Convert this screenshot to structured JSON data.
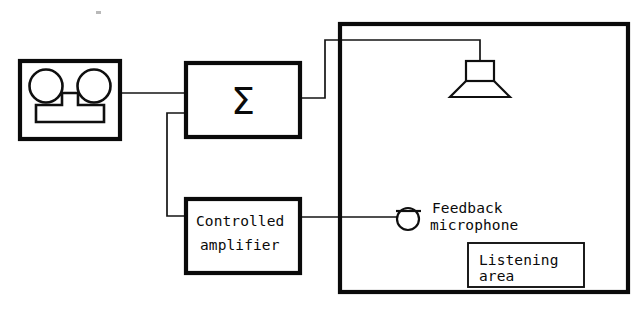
{
  "diagram": {
    "type": "block-diagram",
    "background_color": "#ffffff",
    "line_color": "#0a0a0a",
    "blocks": {
      "tape_recorder": {
        "name": "tape-recorder",
        "label": "",
        "x": 20,
        "y": 61,
        "width": 100,
        "height": 78
      },
      "summing_amplifier": {
        "name": "summing-amplifier",
        "label": "Σ",
        "x": 186,
        "y": 63,
        "width": 114,
        "height": 74
      },
      "controlled_amplifier": {
        "name": "controlled-amplifier",
        "label_line_1": "Controlled",
        "label_line_2": "amplifier",
        "x": 186,
        "y": 199,
        "width": 114,
        "height": 74
      },
      "listening_room": {
        "name": "listening-room",
        "x": 340,
        "y": 24,
        "width": 288,
        "height": 268
      },
      "listening_area": {
        "name": "listening-area",
        "label_line_1": "Listening",
        "label_line_2": "area",
        "x": 468,
        "y": 243,
        "width": 116,
        "height": 44
      }
    },
    "components": {
      "loudspeaker": {
        "name": "loudspeaker",
        "label": ""
      },
      "feedback_microphone": {
        "name": "feedback-microphone",
        "label_line_1": "Feedback",
        "label_line_2": "microphone"
      }
    },
    "signal_paths": [
      {
        "name": "source-to-sum",
        "from": "tape-recorder",
        "to": "summing-amplifier"
      },
      {
        "name": "sum-to-loudspeaker",
        "from": "summing-amplifier",
        "to": "loudspeaker"
      },
      {
        "name": "microphone-to-controlled-amplifier",
        "from": "feedback-microphone",
        "to": "controlled-amplifier"
      },
      {
        "name": "controlled-amplifier-to-sum",
        "from": "controlled-amplifier",
        "to": "summing-amplifier"
      }
    ]
  }
}
